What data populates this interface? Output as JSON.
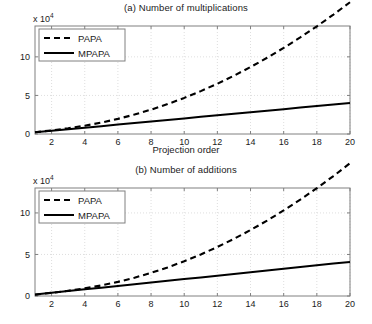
{
  "figure": {
    "width": 372,
    "height": 324,
    "background": "#ffffff",
    "axis_color": "#808080",
    "grid_color": "#c8c8c8",
    "series_color": "#000000"
  },
  "chart_data": [
    {
      "type": "line",
      "panel": "a",
      "title": "(a) Number of multiplications",
      "xlabel": "Projection order",
      "ylabel": "",
      "y_exponent_label": "x 10",
      "y_exponent_value": "4",
      "xlim": [
        1,
        20
      ],
      "ylim": [
        0,
        14
      ],
      "xticks": [
        2,
        4,
        6,
        8,
        10,
        12,
        14,
        16,
        18,
        20
      ],
      "xticklabels": [
        "2",
        "4",
        "6",
        "8",
        "10",
        "12",
        "14",
        "16",
        "18",
        "20"
      ],
      "yticks": [
        0,
        5,
        10
      ],
      "yticklabels": [
        "0",
        "5",
        "10"
      ],
      "grid": true,
      "legend_position": "upper left",
      "x": [
        1,
        2,
        3,
        4,
        5,
        6,
        7,
        8,
        9,
        10,
        11,
        12,
        13,
        14,
        15,
        16,
        17,
        18,
        19,
        20
      ],
      "series": [
        {
          "name": "PAPA",
          "style": "dashed",
          "values": [
            0.22,
            0.47,
            0.75,
            1.08,
            1.48,
            1.96,
            2.52,
            3.16,
            3.88,
            4.68,
            5.56,
            6.52,
            7.56,
            8.68,
            9.88,
            11.16,
            12.52,
            13.96,
            15.48,
            17.08
          ]
        },
        {
          "name": "MPAPA",
          "style": "solid",
          "values": [
            0.22,
            0.42,
            0.62,
            0.82,
            1.02,
            1.22,
            1.42,
            1.62,
            1.82,
            2.02,
            2.22,
            2.42,
            2.62,
            2.82,
            3.02,
            3.22,
            3.42,
            3.62,
            3.82,
            4.02
          ]
        }
      ]
    },
    {
      "type": "line",
      "panel": "b",
      "title": "(b) Number of additions",
      "xlabel": "Projection order",
      "ylabel": "",
      "y_exponent_label": "x 10",
      "y_exponent_value": "4",
      "xlim": [
        1,
        20
      ],
      "ylim": [
        0,
        13
      ],
      "xticks": [
        2,
        4,
        6,
        8,
        10,
        12,
        14,
        16,
        18,
        20
      ],
      "xticklabels": [
        "2",
        "4",
        "6",
        "8",
        "10",
        "12",
        "14",
        "16",
        "18",
        "20"
      ],
      "yticks": [
        0,
        5,
        10
      ],
      "yticklabels": [
        "0",
        "5",
        "10"
      ],
      "grid": true,
      "legend_position": "upper left",
      "x": [
        1,
        2,
        3,
        4,
        5,
        6,
        7,
        8,
        9,
        10,
        11,
        12,
        13,
        14,
        15,
        16,
        17,
        18,
        19,
        20
      ],
      "series": [
        {
          "name": "PAPA",
          "style": "dashed",
          "values": [
            0.16,
            0.38,
            0.63,
            0.92,
            1.27,
            1.7,
            2.2,
            2.78,
            3.44,
            4.18,
            5.0,
            5.9,
            6.88,
            7.94,
            9.08,
            10.3,
            11.6,
            12.98,
            14.44,
            15.98
          ]
        },
        {
          "name": "MPAPA",
          "style": "solid",
          "values": [
            0.18,
            0.38,
            0.59,
            0.8,
            1.0,
            1.21,
            1.42,
            1.62,
            1.83,
            2.04,
            2.24,
            2.45,
            2.66,
            2.86,
            3.07,
            3.28,
            3.48,
            3.69,
            3.9,
            4.1
          ]
        }
      ]
    }
  ]
}
